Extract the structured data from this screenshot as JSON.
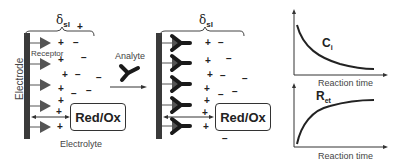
{
  "panel_left": {
    "delta_label": "δ",
    "delta_sub": "sl",
    "electrode_label": "Electrode",
    "receptor_label": "Receptor",
    "redox_label": "Red/Ox",
    "electrolyte_label": "Electrolyte",
    "extra_plus": "+"
  },
  "arrow": {
    "label": "Analyte"
  },
  "panel_right": {
    "delta_label": "δ",
    "delta_sub": "sl",
    "redox_label": "Red/Ox"
  },
  "plots": [
    {
      "curve_label": "C",
      "curve_sub": "i",
      "xlabel": "Reaction time",
      "trend": "decreasing"
    },
    {
      "curve_label": "R",
      "curve_sub": "et",
      "xlabel": "Reaction time",
      "trend": "increasing"
    }
  ],
  "signs": {
    "plus": "+",
    "minus": "−"
  },
  "colors": {
    "electrode": "#3a3a3a",
    "receptor": "#555555",
    "antibody": "#1a1a1a",
    "line": "#333333"
  }
}
